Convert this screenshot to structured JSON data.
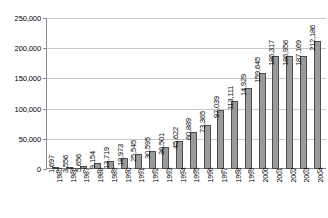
{
  "chart_data": {
    "type": "bar",
    "title": "",
    "subtitle": "",
    "xlabel": "",
    "ylabel": "",
    "ylim": [
      0,
      250000
    ],
    "ytick_labels": [
      "250,000",
      "200,000",
      "150,000",
      "100,000",
      "50,000",
      "0"
    ],
    "ytick_values": [
      250000,
      200000,
      150000,
      100000,
      50000,
      0
    ],
    "grid": true,
    "legend": "none",
    "categories": [
      "1985",
      "1986",
      "1987",
      "1988",
      "1989",
      "1990",
      "1991",
      "1992",
      "1993",
      "1994",
      "1995",
      "1996",
      "1997",
      "1998",
      "1999",
      "2000",
      "2001",
      "2002",
      "2003",
      "2004"
    ],
    "values": [
      1697,
      3556,
      5656,
      9154,
      13719,
      18973,
      25545,
      30595,
      36501,
      45622,
      60889,
      73365,
      97039,
      113111,
      134929,
      159645,
      186317,
      186956,
      187169,
      212186
    ],
    "value_labels": [
      "1,697",
      "3,556",
      "5,656",
      "9,154",
      "13,719",
      "18,973",
      "25,545",
      "30,595",
      "36,501",
      "45,622",
      "60,889",
      "73,365",
      "97,039",
      "113,111",
      "14,929",
      "159,645",
      "186,317",
      "186,956",
      "187,169",
      "212,186"
    ],
    "colors": {
      "bar_fill": "#9a9a9a",
      "bar_border": "#4d4d4d",
      "gridline": "#c9c9c9",
      "axis": "#8a8a8a",
      "text": "#000000",
      "background": "#ffffff"
    }
  }
}
